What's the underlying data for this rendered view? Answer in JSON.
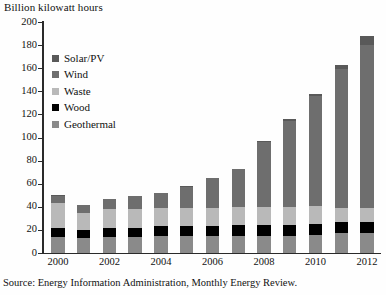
{
  "figure": {
    "axis_title": "Billion kilowatt hours",
    "source_note": "Source: Energy Information Administration, Monthly Energy Review."
  },
  "legend": {
    "items": [
      {
        "label": "Solar/PV",
        "color": "#595959"
      },
      {
        "label": "Wind",
        "color": "#6e6e6e"
      },
      {
        "label": "Waste",
        "color": "#b9b9b9"
      },
      {
        "label": "Wood",
        "color": "#000000"
      },
      {
        "label": "Geothermal",
        "color": "#8a8a8a"
      }
    ]
  },
  "chart_data": {
    "type": "bar",
    "title": "Billion kilowatt hours",
    "xlabel": "",
    "ylabel": "Billion kilowatt hours",
    "ylim": [
      0,
      200
    ],
    "ytick_values": [
      0,
      20,
      40,
      60,
      80,
      100,
      120,
      140,
      160,
      180,
      200
    ],
    "ytick_labels": [
      "0",
      "20",
      "40",
      "60",
      "80",
      "100",
      "120",
      "140",
      "160",
      "180",
      "200"
    ],
    "grid": false,
    "stacked": true,
    "legend_position": "upper-left-inside",
    "categories": [
      "2000",
      "2001",
      "2002",
      "2003",
      "2004",
      "2005",
      "2006",
      "2007",
      "2008",
      "2009",
      "2010",
      "2011",
      "2012"
    ],
    "xtick_labels": [
      "2000",
      "",
      "2002",
      "",
      "2004",
      "",
      "2006",
      "",
      "2008",
      "",
      "2010",
      "",
      "2012"
    ],
    "stack_order_bottom_to_top": [
      "Geothermal",
      "Wood",
      "Waste",
      "Wind",
      "Solar/PV"
    ],
    "series": [
      {
        "name": "Geothermal",
        "color": "#8a8a8a",
        "values": [
          14,
          13,
          14,
          14,
          15,
          15,
          15,
          15,
          15,
          15,
          16,
          17,
          17
        ]
      },
      {
        "name": "Wood",
        "color": "#000000",
        "values": [
          8,
          7,
          8,
          8,
          8,
          8,
          8,
          9,
          9,
          9,
          9,
          10,
          10
        ]
      },
      {
        "name": "Waste",
        "color": "#b9b9b9",
        "values": [
          21,
          15,
          16,
          16,
          16,
          16,
          16,
          16,
          16,
          16,
          16,
          12,
          12
        ]
      },
      {
        "name": "Wind",
        "color": "#6e6e6e",
        "values": [
          6,
          7,
          9,
          11,
          13,
          18,
          26,
          33,
          56,
          74,
          95,
          120,
          141
        ]
      },
      {
        "name": "Solar/PV",
        "color": "#595959",
        "values": [
          1,
          0,
          0,
          0,
          0,
          1,
          0,
          0,
          1,
          2,
          2,
          4,
          8
        ]
      }
    ],
    "totals": [
      50,
      42,
      47,
      49,
      52,
      58,
      65,
      73,
      97,
      116,
      138,
      163,
      188
    ]
  }
}
